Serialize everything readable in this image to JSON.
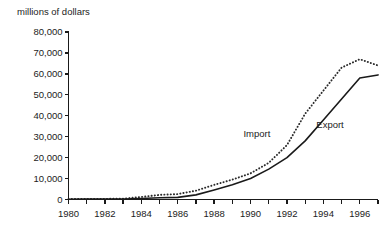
{
  "chart_data": {
    "type": "line",
    "title": "",
    "ylabel": "millions of dollars",
    "xlabel": "",
    "ylim": [
      0,
      80000
    ],
    "xlim": [
      1980,
      1997
    ],
    "grid": false,
    "legend_position": "inline-annotations",
    "ytick_labels": [
      "80,000",
      "70,000",
      "60,000",
      "50,000",
      "40,000",
      "30,000",
      "20,000",
      "10,000",
      "0"
    ],
    "ytick_values": [
      80000,
      70000,
      60000,
      50000,
      40000,
      30000,
      20000,
      10000,
      0
    ],
    "xtick_labels": [
      "1980",
      "1982",
      "1984",
      "1986",
      "1988",
      "1990",
      "1992",
      "1994",
      "1996"
    ],
    "xtick_values": [
      1980,
      1982,
      1984,
      1986,
      1988,
      1990,
      1992,
      1994,
      1996
    ],
    "x": [
      1980,
      1981,
      1982,
      1983,
      1984,
      1985,
      1986,
      1987,
      1988,
      1989,
      1990,
      1991,
      1992,
      1993,
      1994,
      1995,
      1996,
      1997
    ],
    "series": [
      {
        "name": "Import",
        "style": "dotted",
        "color": "#2b2b2b",
        "values": [
          200,
          250,
          300,
          400,
          1200,
          2200,
          2600,
          4200,
          7000,
          9500,
          12500,
          17500,
          26000,
          41000,
          52000,
          63000,
          67000,
          64000
        ]
      },
      {
        "name": "Export",
        "style": "solid",
        "color": "#1a1a1a",
        "values": [
          150,
          180,
          200,
          250,
          500,
          800,
          1000,
          2200,
          4500,
          7000,
          10000,
          14500,
          20000,
          28000,
          38000,
          48000,
          58000,
          59500
        ]
      }
    ],
    "annotations": [
      {
        "text": "Import",
        "x": 1990.6,
        "y": 31500
      },
      {
        "text": "Export",
        "x": 1994.6,
        "y": 35500
      }
    ]
  }
}
